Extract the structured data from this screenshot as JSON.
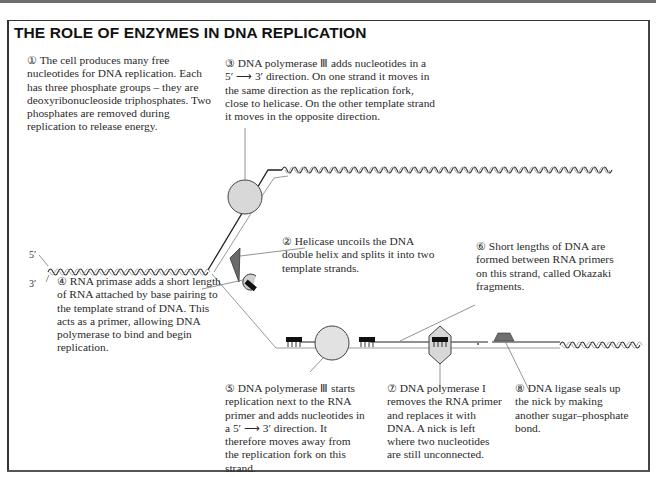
{
  "title": "THE ROLE OF ENZYMES IN DNA REPLICATION",
  "strand_labels": {
    "five_prime": "5′",
    "three_prime": "3′"
  },
  "notes": [
    {
      "number": "①",
      "text": "The cell produces many free nucleotides for DNA replication. Each has three phosphate groups – they are deoxyribonucleoside triphosphates. Two phosphates are removed during replication to release energy."
    },
    {
      "number": "②",
      "text": "Helicase uncoils the DNA double helix and splits it into two template strands."
    },
    {
      "number": "③",
      "text": "DNA polymerase Ⅲ adds nucleotides in a 5′ ⟶ 3′ direction. On one strand it moves in the same direction as the replication fork, close to helicase. On the other template strand it moves in the opposite direction."
    },
    {
      "number": "④",
      "text": "RNA primase adds a short length of RNA attached by base pairing to the template strand of DNA. This acts as a primer, allowing DNA polymerase to bind and begin replication."
    },
    {
      "number": "⑤",
      "text": "DNA polymerase Ⅲ starts replication next to the RNA primer and adds nucleotides in a 5′ ⟶ 3′ direction. It therefore moves away from the replication fork on this strand."
    },
    {
      "number": "⑥",
      "text": "Short lengths of DNA are formed between RNA primers on this strand, called Okazaki fragments."
    },
    {
      "number": "⑦",
      "text": "DNA polymerase I removes the RNA primer and replaces it with DNA. A nick is left where two nucleotides are still unconnected."
    },
    {
      "number": "⑧",
      "text": "DNA ligase seals up the nick by making another sugar–phosphate bond."
    }
  ],
  "colors": {
    "enzyme_fill": "#d8d8d8",
    "helicase_fill": "#6a6a6a",
    "ligase_fill": "#707070",
    "primer_fill": "#111111",
    "strand": "#222222",
    "strand_light": "#aaaaaa"
  }
}
